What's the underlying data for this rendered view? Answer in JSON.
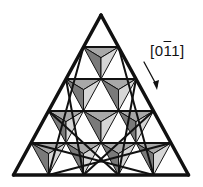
{
  "figure": {
    "rows": 5,
    "direction_label": {
      "open": "[",
      "d1": "0",
      "d2": "1",
      "d3": "1",
      "close": "]",
      "overbar_index": 2
    },
    "colors": {
      "line": "#111111",
      "facet_top": "#a8a8a8",
      "facet_left": "#7a7a7a",
      "facet_right": "#d6d6d6",
      "background": "#ffffff"
    }
  }
}
